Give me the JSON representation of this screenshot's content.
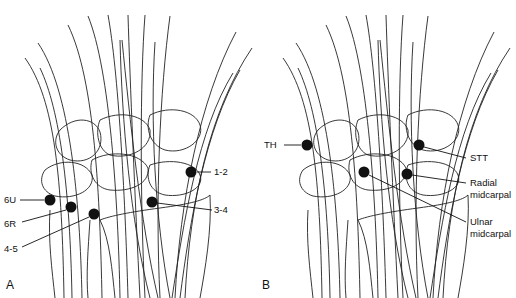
{
  "figure": {
    "panels": [
      {
        "letter": "A",
        "portals": [
          {
            "label": "1-2",
            "x": 191,
            "y": 172
          },
          {
            "label": "3-4",
            "x": 152,
            "y": 202
          },
          {
            "label": "6U",
            "x": 50,
            "y": 200
          },
          {
            "label": "6R",
            "x": 71,
            "y": 207
          },
          {
            "label": "4-5",
            "x": 94,
            "y": 214
          }
        ]
      },
      {
        "letter": "B",
        "portals": [
          {
            "label": "TH",
            "line1": "TH"
          },
          {
            "label": "STT",
            "line1": "STT"
          },
          {
            "label": "Radial midcarpal",
            "line1": "Radial",
            "line2": "midcarpal"
          },
          {
            "label": "Ulnar midcarpal",
            "line1": "Ulnar",
            "line2": "midcarpal"
          }
        ]
      }
    ],
    "colors": {
      "ink": "#111111",
      "background": "#ffffff"
    }
  }
}
